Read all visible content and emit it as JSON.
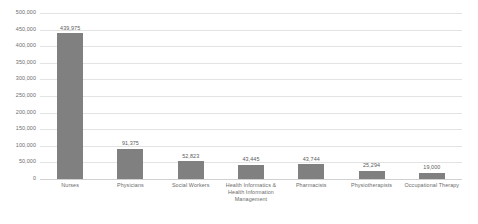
{
  "chart_data": {
    "type": "bar",
    "title": "",
    "subtitle": "",
    "xlabel": "",
    "ylabel": "",
    "ylim": [
      0,
      500000
    ],
    "grid": true,
    "legend": false,
    "bar_color": "#808080",
    "gridline_color": "#e3e3e3",
    "text_color": "#6b6b6b",
    "background": "#ffffff",
    "categories": [
      "Nurses",
      "Physicians",
      "Social Workers",
      "Health Informatics & Health Information Management",
      "Pharmacists",
      "Physiotherapists",
      "Occupational Therapy"
    ],
    "values": [
      439975,
      91375,
      52823,
      43445,
      43744,
      25294,
      19000
    ],
    "value_labels": [
      "439,975",
      "91,375",
      "52,823",
      "43,445",
      "43,744",
      "25,294",
      "19,000"
    ],
    "category_lines": [
      [
        "Nurses"
      ],
      [
        "Physicians"
      ],
      [
        "Social Workers"
      ],
      [
        "Health Informatics &",
        "Health Information",
        "Management"
      ],
      [
        "Pharmacists"
      ],
      [
        "Physiotherapists"
      ],
      [
        "Occupational Therapy"
      ]
    ],
    "y_ticks": [
      0,
      50000,
      100000,
      150000,
      200000,
      250000,
      300000,
      350000,
      400000,
      450000,
      500000
    ],
    "y_tick_labels": [
      "0",
      "50,000",
      "100,000",
      "150,000",
      "200,000",
      "250,000",
      "300,000",
      "350,000",
      "400,000",
      "450,000",
      "500,000"
    ]
  }
}
